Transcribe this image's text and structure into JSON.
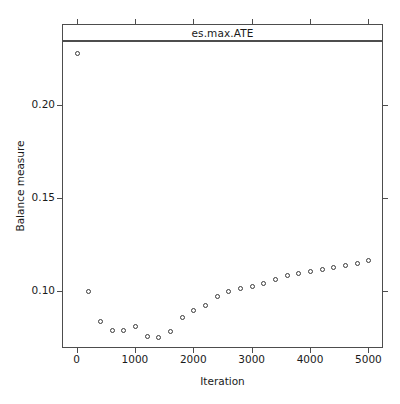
{
  "chart_data": {
    "type": "scatter",
    "title": "es.max.ATE",
    "xlabel": "Iteration",
    "ylabel": "Balance measure",
    "xlim": [
      -250,
      5250
    ],
    "ylim": [
      0.0695,
      0.2345
    ],
    "xticks": [
      0,
      1000,
      2000,
      3000,
      4000,
      5000
    ],
    "xtick_labels": [
      "0",
      "1000",
      "2000",
      "3000",
      "4000",
      "5000"
    ],
    "yticks": [
      0.1,
      0.15,
      0.2
    ],
    "ytick_labels": [
      "0.10",
      "0.15",
      "0.20"
    ],
    "grid": false,
    "legend": null,
    "marker": "open-circle",
    "marker_color": "#3a3a3a",
    "frame_color": "#4d4d4d",
    "x": [
      0,
      200,
      400,
      600,
      800,
      1000,
      1200,
      1400,
      1600,
      1800,
      2000,
      2200,
      2400,
      2600,
      2800,
      3000,
      3200,
      3400,
      3600,
      3800,
      4000,
      4200,
      4400,
      4600,
      4800,
      5000
    ],
    "values": [
      0.228,
      0.0999,
      0.0838,
      0.0792,
      0.0792,
      0.0812,
      0.0757,
      0.0755,
      0.0786,
      0.0861,
      0.0898,
      0.0928,
      0.0973,
      0.0999,
      0.1018,
      0.1026,
      0.1043,
      0.1064,
      0.1085,
      0.1099,
      0.111,
      0.112,
      0.1131,
      0.1141,
      0.1152,
      0.1168
    ],
    "n_points": 26
  },
  "figure": {
    "background": "#ffffff"
  }
}
